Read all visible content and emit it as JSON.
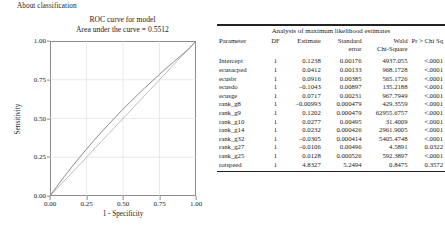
{
  "header": {
    "about_label": "About classification"
  },
  "chart_panel": {
    "title": "ROC curve for model",
    "subtitle": "Area under the curve = 0.5512",
    "y_axis_label": "Sensitivity",
    "x_axis_label": "1 - Specificity"
  },
  "chart_data": {
    "type": "line",
    "title": "ROC curve for model",
    "subtitle": "Area under the curve = 0.5512",
    "auc": 0.5512,
    "xlabel": "1 - Specificity",
    "ylabel": "Sensitivity",
    "xlim": [
      0.0,
      1.0
    ],
    "ylim": [
      0.0,
      1.0
    ],
    "xticks": [
      "0.00",
      "0.25",
      "0.50",
      "0.75",
      "1.00"
    ],
    "yticks": [
      "0.00",
      "0.25",
      "0.50",
      "0.75",
      "1.00"
    ],
    "grid": true,
    "legend": "none",
    "series": [
      {
        "name": "ROC curve",
        "color": "#8a8a8a",
        "x": [
          0.0,
          0.05,
          0.1,
          0.15,
          0.2,
          0.25,
          0.3,
          0.35,
          0.4,
          0.45,
          0.5,
          0.55,
          0.6,
          0.65,
          0.7,
          0.75,
          0.8,
          0.85,
          0.9,
          0.95,
          1.0
        ],
        "y": [
          0.0,
          0.065,
          0.128,
          0.188,
          0.246,
          0.302,
          0.357,
          0.41,
          0.461,
          0.511,
          0.56,
          0.607,
          0.653,
          0.698,
          0.742,
          0.785,
          0.827,
          0.868,
          0.908,
          0.948,
          1.0
        ]
      },
      {
        "name": "Reference diagonal",
        "color": "#b8b8b8",
        "x": [
          0.0,
          1.0
        ],
        "y": [
          0.0,
          1.0
        ]
      }
    ]
  },
  "table": {
    "caption": "Analysis of maximum likelihood estimates",
    "columns": [
      {
        "line1": "Parameter",
        "line2": ""
      },
      {
        "line1": "DF",
        "line2": ""
      },
      {
        "line1": "Estimate",
        "line2": ""
      },
      {
        "line1": "Standard",
        "line2": "error"
      },
      {
        "line1": "Wald",
        "line2": "Chi-Square"
      },
      {
        "line1": "Pr > Chi Sq",
        "line2": ""
      }
    ],
    "rows": [
      {
        "parameter": "Intercept",
        "df": "1",
        "estimate": "0.1238",
        "std_error": "0.00176",
        "wald_chi_square": "4937.055",
        "pr_chi_sq": "<.0001"
      },
      {
        "parameter": "ecusacped",
        "df": "1",
        "estimate": "0.0412",
        "std_error": "0.00133",
        "wald_chi_square": "968.1728",
        "pr_chi_sq": "<.0001"
      },
      {
        "parameter": "ecusbr",
        "df": "1",
        "estimate": "0.0916",
        "std_error": "0.00385",
        "wald_chi_square": "565.1726",
        "pr_chi_sq": "<.0001"
      },
      {
        "parameter": "ecusdo",
        "df": "1",
        "estimate": "–0.1043",
        "std_error": "0.00897",
        "wald_chi_square": "135.2188",
        "pr_chi_sq": "<.0001"
      },
      {
        "parameter": "ecusge",
        "df": "1",
        "estimate": "0.0717",
        "std_error": "0.00231",
        "wald_chi_square": "967.7949",
        "pr_chi_sq": "<.0001"
      },
      {
        "parameter": "rank_g8",
        "df": "1",
        "estimate": "–0.00993",
        "std_error": "0.000479",
        "wald_chi_square": "429.3559",
        "pr_chi_sq": "<.0001"
      },
      {
        "parameter": "rank_g9",
        "df": "1",
        "estimate": "0.1202",
        "std_error": "0.000479",
        "wald_chi_square": "62955.6757",
        "pr_chi_sq": "<.0001"
      },
      {
        "parameter": "rank_g10",
        "df": "1",
        "estimate": "0.0277",
        "std_error": "0.00495",
        "wald_chi_square": "31.4009",
        "pr_chi_sq": "<.0001"
      },
      {
        "parameter": "rank_g14",
        "df": "1",
        "estimate": "0.0232",
        "std_error": "0.000426",
        "wald_chi_square": "2961.9005",
        "pr_chi_sq": "<.0001"
      },
      {
        "parameter": "rank_g32",
        "df": "1",
        "estimate": "–0.0305",
        "std_error": "0.000414",
        "wald_chi_square": "5405.4748",
        "pr_chi_sq": "<.0001"
      },
      {
        "parameter": "rank_g27",
        "df": "1",
        "estimate": "–0.0106",
        "std_error": "0.00496",
        "wald_chi_square": "4.5891",
        "pr_chi_sq": "0.0322"
      },
      {
        "parameter": "rank_g25",
        "df": "1",
        "estimate": "0.0128",
        "std_error": "0.000526",
        "wald_chi_square": "592.3897",
        "pr_chi_sq": "<.0001"
      },
      {
        "parameter": "rotspeed",
        "df": "1",
        "estimate": "4.8327",
        "std_error": "5.2494",
        "wald_chi_square": "0.8475",
        "pr_chi_sq": "0.3572"
      }
    ]
  }
}
